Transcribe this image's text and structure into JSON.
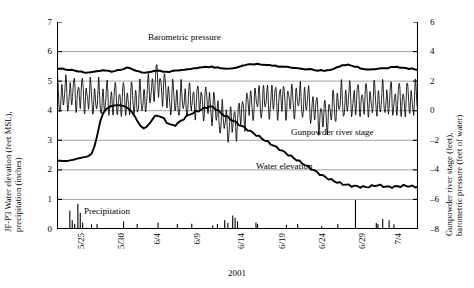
{
  "chart_data": {
    "type": "line",
    "title": "",
    "xlabel": "2001",
    "ylabel_left": "JF-P3 Water elevation (feet MSL), precipitation (inches)",
    "ylabel_left_line1": "JF-P3 Water elevation (feet MSL),",
    "ylabel_left_line2": "precipitation (inches)",
    "ylabel_right": "Gunpowder river stage (feet), barometric pressure (feet of water)",
    "ylabel_right_line1": "Gunpowder river stage (feet),",
    "ylabel_right_line2": "barometric pressure (feet of water)",
    "ylim_left": [
      0,
      7
    ],
    "ylim_right": [
      -8,
      6
    ],
    "yticks_left": [
      "7",
      "6",
      "5",
      "4",
      "3",
      "2",
      "1",
      "0"
    ],
    "yticks_right": [
      "6",
      "4",
      "2",
      "0",
      "-2",
      "-4",
      "-6",
      "-8"
    ],
    "xticks": [
      "5/25",
      "5/30",
      "6/4",
      "6/9",
      "6/14",
      "6/19",
      "6/24",
      "6/29",
      "7/4"
    ],
    "xtick_day_offsets": [
      0,
      5,
      10,
      15,
      20,
      25,
      30,
      35,
      40
    ],
    "x_range_days": [
      0,
      45
    ],
    "grid": "horizontal",
    "legend": "inline-annotations",
    "colors": {
      "line": "#000000",
      "grid": "#8a8a8a",
      "axis": "#000000"
    },
    "series": [
      {
        "name": "Barometric pressure",
        "axis": "right",
        "units": "feet of water",
        "label_x_day": 12.5,
        "values_left_axis": [
          5.42,
          5.41,
          5.4,
          5.39,
          5.38,
          5.37,
          5.35,
          5.33,
          5.31,
          5.3,
          5.29,
          5.3,
          5.32,
          5.34,
          5.35,
          5.36,
          5.35,
          5.34,
          5.33,
          5.34,
          5.36,
          5.39,
          5.42,
          5.45,
          5.44,
          5.41,
          5.37,
          5.33,
          5.3,
          5.29,
          5.3,
          5.32,
          5.34,
          5.35,
          5.34,
          5.32,
          5.31,
          5.32,
          5.34,
          5.36,
          5.38,
          5.39,
          5.4,
          5.41,
          5.42,
          5.43,
          5.44,
          5.45,
          5.46,
          5.47,
          5.48,
          5.48,
          5.47,
          5.46,
          5.45,
          5.44,
          5.43,
          5.43,
          5.44,
          5.46,
          5.49,
          5.52,
          5.55,
          5.57,
          5.58,
          5.58,
          5.57,
          5.56,
          5.55,
          5.54,
          5.53,
          5.52,
          5.51,
          5.5,
          5.49,
          5.48,
          5.47,
          5.46,
          5.45,
          5.44,
          5.43,
          5.42,
          5.41,
          5.4,
          5.39,
          5.38,
          5.37,
          5.36,
          5.36,
          5.37,
          5.39,
          5.42,
          5.46,
          5.5,
          5.53,
          5.55,
          5.55,
          5.53,
          5.5,
          5.47,
          5.44,
          5.42,
          5.41,
          5.4,
          5.4,
          5.41,
          5.42,
          5.43,
          5.44,
          5.45,
          5.46,
          5.47,
          5.47,
          5.46,
          5.45,
          5.44,
          5.43,
          5.42,
          5.41,
          5.4
        ],
        "mean_right_axis": 2.8
      },
      {
        "name": "Gunpowder river stage",
        "axis": "right",
        "units": "feet",
        "label_x_day": 26,
        "description": "high-frequency tidal oscillation, amplitude ~0.5 ft left-axis units, mean ~4.35",
        "mean_left_axis": 4.35,
        "tidal_amplitude_left_axis": 0.45,
        "mean_right_axis": 0.7,
        "notable_peak_left_axis": 5.0,
        "notable_peak_day": 12.5,
        "notable_low_left_axis": 3.25,
        "notable_low_day": 21.5
      },
      {
        "name": "Water elevation",
        "axis": "left",
        "units": "feet MSL",
        "label_x_day": 23,
        "values": [
          2.32,
          2.31,
          2.3,
          2.3,
          2.31,
          2.33,
          2.35,
          2.38,
          2.4,
          2.42,
          2.44,
          2.47,
          2.55,
          2.8,
          3.2,
          3.65,
          3.92,
          4.05,
          4.12,
          4.16,
          4.18,
          4.19,
          4.18,
          4.16,
          4.12,
          4.05,
          3.95,
          3.8,
          3.62,
          3.48,
          3.4,
          3.45,
          3.56,
          3.7,
          3.8,
          3.84,
          3.8,
          3.72,
          3.62,
          3.54,
          3.5,
          3.52,
          3.58,
          3.66,
          3.74,
          3.82,
          3.88,
          3.92,
          3.96,
          4.0,
          4.04,
          4.08,
          4.12,
          4.14,
          4.12,
          4.06,
          3.98,
          3.9,
          3.84,
          3.78,
          3.72,
          3.66,
          3.6,
          3.54,
          3.48,
          3.42,
          3.36,
          3.3,
          3.24,
          3.18,
          3.12,
          3.06,
          3.0,
          2.94,
          2.88,
          2.82,
          2.76,
          2.7,
          2.64,
          2.58,
          2.52,
          2.46,
          2.4,
          2.34,
          2.28,
          2.22,
          2.16,
          2.1,
          2.04,
          1.98,
          1.92,
          1.86,
          1.8,
          1.75,
          1.7,
          1.66,
          1.62,
          1.58,
          1.55,
          1.52,
          1.5,
          1.48,
          1.46,
          1.45,
          1.44,
          1.43,
          1.42,
          1.42,
          1.43,
          1.45,
          1.47,
          1.48,
          1.47,
          1.45,
          1.43,
          1.42,
          1.42,
          1.43,
          1.44,
          1.45,
          1.46,
          1.46,
          1.45,
          1.44,
          1.43,
          1.43
        ],
        "start_value": 2.32,
        "peak_value": 4.19,
        "peak_day": 7.5,
        "end_value": 1.43
      },
      {
        "name": "Precipitation",
        "axis": "left",
        "units": "inches",
        "type": "bar",
        "label_x_day": 3.5,
        "events": [
          {
            "day": 1.6,
            "value": 0.62
          },
          {
            "day": 1.9,
            "value": 0.3
          },
          {
            "day": 2.2,
            "value": 0.18
          },
          {
            "day": 2.6,
            "value": 0.85
          },
          {
            "day": 2.9,
            "value": 0.55
          },
          {
            "day": 3.2,
            "value": 0.22
          },
          {
            "day": 4.3,
            "value": 0.16
          },
          {
            "day": 8.3,
            "value": 0.25
          },
          {
            "day": 12.6,
            "value": 0.22
          },
          {
            "day": 16.8,
            "value": 0.18
          },
          {
            "day": 19.4,
            "value": 0.12
          },
          {
            "day": 20.9,
            "value": 0.3
          },
          {
            "day": 21.3,
            "value": 0.2
          },
          {
            "day": 21.9,
            "value": 0.46
          },
          {
            "day": 22.2,
            "value": 0.38
          },
          {
            "day": 22.5,
            "value": 0.26
          },
          {
            "day": 24.8,
            "value": 0.22
          },
          {
            "day": 28.6,
            "value": 0.14
          },
          {
            "day": 33.0,
            "value": 0.1
          },
          {
            "day": 37.2,
            "value": 0.98
          },
          {
            "day": 39.8,
            "value": 0.2
          },
          {
            "day": 40.6,
            "value": 0.34
          },
          {
            "day": 41.4,
            "value": 0.3
          },
          {
            "day": 42.0,
            "value": 0.16
          }
        ]
      }
    ],
    "annotations": [
      {
        "text": "Barometric pressure"
      },
      {
        "text": "Gunpowder river stage"
      },
      {
        "text": "Water elevation"
      },
      {
        "text": "Precipitation"
      }
    ]
  }
}
